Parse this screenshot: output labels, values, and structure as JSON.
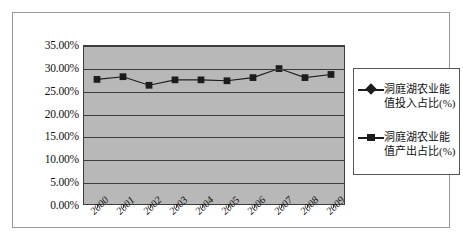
{
  "chart_data": {
    "type": "line",
    "title": "",
    "xlabel": "",
    "ylabel": "",
    "categories": [
      "2000",
      "2001",
      "2002",
      "2003",
      "2004",
      "2005",
      "2006",
      "2007",
      "2008",
      "2009"
    ],
    "ylim": [
      0,
      35
    ],
    "ytick_labels": [
      "0.00%",
      "5.00%",
      "10.00%",
      "15.00%",
      "20.00%",
      "25.00%",
      "30.00%",
      "35.00%"
    ],
    "ytick_values": [
      0,
      5,
      10,
      15,
      20,
      25,
      30,
      35
    ],
    "ytick_step": 5,
    "grid": true,
    "legend_position": "right",
    "plot_background": "#b8b8b8",
    "series": [
      {
        "name": "洞庭湖农业能值投入占比(%)",
        "marker": "diamond",
        "color": "#1c1c1c",
        "values": [
          null,
          null,
          null,
          null,
          null,
          null,
          null,
          null,
          null,
          null
        ]
      },
      {
        "name": "洞庭湖农业能值产出占比(%)",
        "marker": "square",
        "color": "#1c1c1c",
        "values": [
          27.6,
          28.2,
          26.3,
          27.5,
          27.5,
          27.3,
          28.0,
          30.0,
          28.0,
          28.7
        ]
      }
    ]
  },
  "legend": {
    "entries": [
      {
        "line1": "洞庭湖农业能",
        "line2": "值投入占比(%)",
        "marker": "diamond"
      },
      {
        "line1": "洞庭湖农业能",
        "line2": "值产出占比(%)",
        "marker": "square"
      }
    ]
  }
}
